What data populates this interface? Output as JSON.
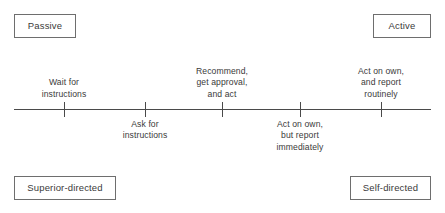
{
  "diagram": {
    "axis": {
      "line_color": "#4a4a4a",
      "x_start": 14,
      "x_end": 431,
      "y": 109
    },
    "corner_labels": {
      "top_left": "Passive",
      "top_right": "Active",
      "bottom_left": "Superior-directed",
      "bottom_right": "Self-directed"
    },
    "points": [
      {
        "id": "wait-for-instructions",
        "x": 64,
        "side": "above",
        "lines": [
          "Wait for",
          "instructions"
        ]
      },
      {
        "id": "ask-for-instructions",
        "x": 145,
        "side": "below",
        "lines": [
          "Ask for",
          "instructions"
        ]
      },
      {
        "id": "recommend-get-approval-and-act",
        "x": 222,
        "side": "above",
        "lines": [
          "Recommend,",
          "get approval,",
          "and act"
        ]
      },
      {
        "id": "act-on-own-but-report-immediately",
        "x": 300,
        "side": "below",
        "lines": [
          "Act on own,",
          "but report",
          "immediately"
        ]
      },
      {
        "id": "act-on-own-and-report-routinely",
        "x": 381,
        "side": "above",
        "lines": [
          "Act on own,",
          "and report",
          "routinely"
        ]
      }
    ]
  }
}
